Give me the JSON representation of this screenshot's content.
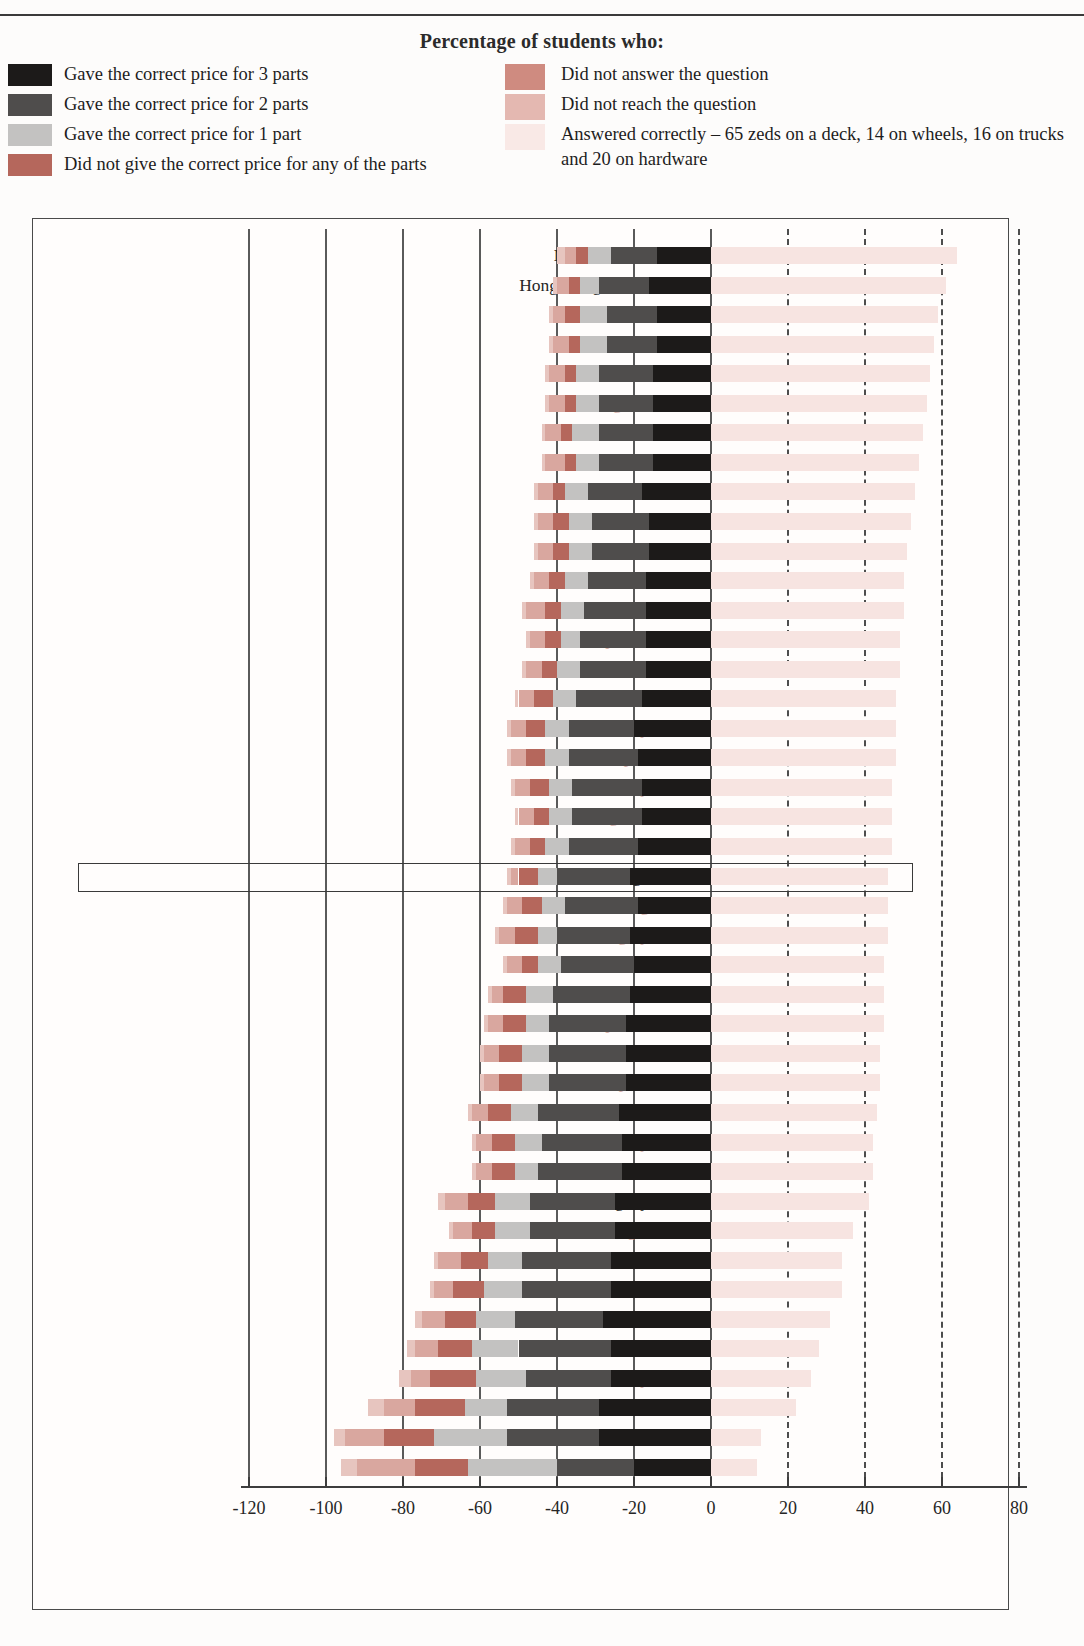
{
  "page": {
    "crumb": "",
    "legend_title": "Percentage of students who:"
  },
  "legend": {
    "left": [
      {
        "label": "Gave the correct price for 3 parts",
        "color": "#1c1a19",
        "key": "s3"
      },
      {
        "label": "Gave the correct price for 2 parts",
        "color": "#4f4d4c",
        "key": "s2"
      },
      {
        "label": "Gave the correct price for 1 part",
        "color": "#c3c2c1",
        "key": "s1"
      },
      {
        "label": "Did not give the correct price for any of the parts",
        "color": "#b5675c",
        "key": "s0"
      }
    ],
    "right": [
      {
        "label": "Did not answer the question",
        "color": "#cf8b80",
        "key": "sna"
      },
      {
        "label": "Did not reach the question",
        "color": "#e4b8b1",
        "key": "snr"
      },
      {
        "label": "Answered correctly – 65 zeds on a deck, 14 on wheels, 16 on trucks and 20 on hardware",
        "color": "#f9e9e6",
        "key": "sok"
      }
    ]
  },
  "axis": {
    "ticks": [
      "-120",
      "-100",
      "-80",
      "-60",
      "-40",
      "-20",
      "0",
      "20",
      "40",
      "60",
      "80"
    ],
    "tick_values": [
      -120,
      -100,
      -80,
      -60,
      -40,
      -20,
      0,
      20,
      40,
      60,
      80
    ],
    "min": -130,
    "max": 85,
    "dashed_from": 20
  },
  "chart_data": {
    "type": "bar",
    "orientation": "horizontal",
    "stacked": true,
    "diverging": true,
    "title": "Percentage of students who:",
    "xlabel": "",
    "ylabel": "",
    "xlim": [
      -130,
      85
    ],
    "grid": true,
    "legend_position": "top",
    "series": [
      {
        "name": "Gave the correct price for 3 parts",
        "key": "s3",
        "color": "#1c1a19",
        "side": "negative"
      },
      {
        "name": "Gave the correct price for 2 parts",
        "key": "s2",
        "color": "#4f4d4c",
        "side": "negative"
      },
      {
        "name": "Gave the correct price for 1 part",
        "key": "s1",
        "color": "#c3c2c1",
        "side": "negative"
      },
      {
        "name": "Did not give the correct price for any of the parts",
        "key": "s0",
        "color": "#b5675c",
        "side": "negative"
      },
      {
        "name": "Did not answer the question",
        "key": "sna",
        "color": "#d9a79f",
        "side": "negative"
      },
      {
        "name": "Did not reach the question",
        "key": "snr",
        "color": "#e7c5bf",
        "side": "negative"
      },
      {
        "name": "Answered correctly",
        "key": "sok",
        "color": "#f7e4e1",
        "side": "positive"
      }
    ],
    "categories": [
      "Macao-China",
      "Hong Kong-China",
      "Finland",
      "Canada",
      "Sweden",
      "Belgium",
      "Australia",
      "Netherlands",
      "New Zealand",
      "Korea",
      "Liechtenstein",
      "Iceland",
      "France",
      "Czech Republic",
      "Switzerland",
      "Denmark",
      "Norway",
      "Japan",
      "Germany",
      "United Kingdom",
      "Ireland",
      "OECD average",
      "Luxembourg",
      "Hungary",
      "Austria",
      "Latvia",
      "Slovak Republic",
      "United States",
      "Spain",
      "Russian Federation",
      "Italy",
      "Poland",
      "Uruguay",
      "Portugal",
      "Greece",
      "Serbia",
      "Mexico",
      "Thailand",
      "Turkey",
      "Brazil",
      "Tunisia",
      "Indonesia"
    ],
    "rows": [
      {
        "label": "Macao-China",
        "type": "partner",
        "s3": 14,
        "s2": 12,
        "s1": 6,
        "s0": 3,
        "sna": 3,
        "snr": 2,
        "sok": 64
      },
      {
        "label": "Hong Kong-China",
        "type": "partner",
        "s3": 16,
        "s2": 13,
        "s1": 5,
        "s0": 3,
        "sna": 3,
        "snr": 1,
        "sok": 61
      },
      {
        "label": "Finland",
        "type": "member",
        "s3": 14,
        "s2": 13,
        "s1": 7,
        "s0": 4,
        "sna": 3,
        "snr": 1,
        "sok": 59
      },
      {
        "label": "Canada",
        "type": "member",
        "s3": 14,
        "s2": 13,
        "s1": 7,
        "s0": 3,
        "sna": 4,
        "snr": 1,
        "sok": 58
      },
      {
        "label": "Sweden",
        "type": "member",
        "s3": 15,
        "s2": 14,
        "s1": 6,
        "s0": 3,
        "sna": 4,
        "snr": 1,
        "sok": 57
      },
      {
        "label": "Belgium",
        "type": "member",
        "s3": 15,
        "s2": 14,
        "s1": 6,
        "s0": 3,
        "sna": 4,
        "snr": 1,
        "sok": 56
      },
      {
        "label": "Australia",
        "type": "member",
        "s3": 15,
        "s2": 14,
        "s1": 7,
        "s0": 3,
        "sna": 4,
        "snr": 1,
        "sok": 55
      },
      {
        "label": "Netherlands",
        "type": "member",
        "s3": 15,
        "s2": 14,
        "s1": 6,
        "s0": 3,
        "sna": 5,
        "snr": 1,
        "sok": 54
      },
      {
        "label": "New Zealand",
        "type": "member",
        "s3": 18,
        "s2": 14,
        "s1": 6,
        "s0": 3,
        "sna": 4,
        "snr": 1,
        "sok": 53
      },
      {
        "label": "Korea",
        "type": "member",
        "s3": 16,
        "s2": 15,
        "s1": 6,
        "s0": 4,
        "sna": 4,
        "snr": 1,
        "sok": 52
      },
      {
        "label": "Liechtenstein",
        "type": "partner",
        "s3": 16,
        "s2": 15,
        "s1": 6,
        "s0": 4,
        "sna": 4,
        "snr": 1,
        "sok": 51
      },
      {
        "label": "Iceland",
        "type": "member",
        "s3": 17,
        "s2": 15,
        "s1": 6,
        "s0": 4,
        "sna": 4,
        "snr": 1,
        "sok": 50
      },
      {
        "label": "France",
        "type": "member",
        "s3": 17,
        "s2": 16,
        "s1": 6,
        "s0": 4,
        "sna": 5,
        "snr": 1,
        "sok": 50
      },
      {
        "label": "Czech Republic",
        "type": "member",
        "s3": 17,
        "s2": 17,
        "s1": 5,
        "s0": 4,
        "sna": 4,
        "snr": 1,
        "sok": 49
      },
      {
        "label": "Switzerland",
        "type": "member",
        "s3": 17,
        "s2": 17,
        "s1": 6,
        "s0": 4,
        "sna": 4,
        "snr": 1,
        "sok": 49
      },
      {
        "label": "Denmark",
        "type": "member",
        "s3": 18,
        "s2": 17,
        "s1": 6,
        "s0": 5,
        "sna": 4,
        "snr": 1,
        "sok": 48
      },
      {
        "label": "Norway",
        "type": "member",
        "s3": 20,
        "s2": 17,
        "s1": 6,
        "s0": 5,
        "sna": 4,
        "snr": 1,
        "sok": 48
      },
      {
        "label": "Japan",
        "type": "member",
        "s3": 19,
        "s2": 18,
        "s1": 6,
        "s0": 5,
        "sna": 4,
        "snr": 1,
        "sok": 48
      },
      {
        "label": "Germany",
        "type": "member",
        "s3": 18,
        "s2": 18,
        "s1": 6,
        "s0": 5,
        "sna": 4,
        "snr": 1,
        "sok": 47
      },
      {
        "label": "United Kingdom",
        "type": "member",
        "s3": 18,
        "s2": 18,
        "s1": 6,
        "s0": 4,
        "sna": 4,
        "snr": 1,
        "sok": 47
      },
      {
        "label": "Ireland",
        "type": "member",
        "s3": 19,
        "s2": 18,
        "s1": 6,
        "s0": 4,
        "sna": 4,
        "snr": 1,
        "sok": 47
      },
      {
        "label": "OECD average",
        "type": "oecd",
        "s3": 21,
        "s2": 19,
        "s1": 5,
        "s0": 5,
        "sna": 2,
        "snr": 1,
        "sok": 46
      },
      {
        "label": "Luxembourg",
        "type": "member",
        "s3": 19,
        "s2": 19,
        "s1": 6,
        "s0": 5,
        "sna": 4,
        "snr": 1,
        "sok": 46
      },
      {
        "label": "Hungary",
        "type": "member",
        "s3": 21,
        "s2": 19,
        "s1": 5,
        "s0": 6,
        "sna": 4,
        "snr": 1,
        "sok": 46
      },
      {
        "label": "Austria",
        "type": "member",
        "s3": 20,
        "s2": 19,
        "s1": 6,
        "s0": 4,
        "sna": 4,
        "snr": 1,
        "sok": 45
      },
      {
        "label": "Latvia",
        "type": "partner",
        "s3": 21,
        "s2": 20,
        "s1": 7,
        "s0": 6,
        "sna": 3,
        "snr": 1,
        "sok": 45
      },
      {
        "label": "Slovak Republic",
        "type": "member",
        "s3": 22,
        "s2": 20,
        "s1": 6,
        "s0": 6,
        "sna": 4,
        "snr": 1,
        "sok": 45
      },
      {
        "label": "United States",
        "type": "member",
        "s3": 22,
        "s2": 20,
        "s1": 7,
        "s0": 6,
        "sna": 4,
        "snr": 1,
        "sok": 44
      },
      {
        "label": "Spain",
        "type": "member",
        "s3": 22,
        "s2": 20,
        "s1": 7,
        "s0": 6,
        "sna": 4,
        "snr": 1,
        "sok": 44
      },
      {
        "label": "Russian Federation",
        "type": "partner",
        "s3": 24,
        "s2": 21,
        "s1": 7,
        "s0": 6,
        "sna": 4,
        "snr": 1,
        "sok": 43
      },
      {
        "label": "Italy",
        "type": "member",
        "s3": 23,
        "s2": 21,
        "s1": 7,
        "s0": 6,
        "sna": 4,
        "snr": 1,
        "sok": 42
      },
      {
        "label": "Poland",
        "type": "member",
        "s3": 23,
        "s2": 22,
        "s1": 6,
        "s0": 6,
        "sna": 4,
        "snr": 1,
        "sok": 42
      },
      {
        "label": "Uruguay",
        "type": "partner",
        "s3": 25,
        "s2": 22,
        "s1": 9,
        "s0": 7,
        "sna": 6,
        "snr": 2,
        "sok": 41
      },
      {
        "label": "Portugal",
        "type": "member",
        "s3": 25,
        "s2": 22,
        "s1": 9,
        "s0": 6,
        "sna": 5,
        "snr": 1,
        "sok": 37
      },
      {
        "label": "Greece",
        "type": "member",
        "s3": 26,
        "s2": 23,
        "s1": 9,
        "s0": 7,
        "sna": 6,
        "snr": 1,
        "sok": 34
      },
      {
        "label": "Serbia",
        "type": "partner",
        "s3": 26,
        "s2": 23,
        "s1": 10,
        "s0": 8,
        "sna": 5,
        "snr": 1,
        "sok": 34
      },
      {
        "label": "Mexico",
        "type": "member",
        "s3": 28,
        "s2": 23,
        "s1": 10,
        "s0": 8,
        "sna": 6,
        "snr": 2,
        "sok": 31
      },
      {
        "label": "Thailand",
        "type": "partner",
        "s3": 26,
        "s2": 24,
        "s1": 12,
        "s0": 9,
        "sna": 6,
        "snr": 2,
        "sok": 28
      },
      {
        "label": "Turkey",
        "type": "member",
        "s3": 26,
        "s2": 22,
        "s1": 13,
        "s0": 12,
        "sna": 5,
        "snr": 3,
        "sok": 26
      },
      {
        "label": "Brazil",
        "type": "partner",
        "s3": 29,
        "s2": 24,
        "s1": 11,
        "s0": 13,
        "sna": 8,
        "snr": 4,
        "sok": 22
      },
      {
        "label": "Tunisia",
        "type": "partner",
        "s3": 29,
        "s2": 24,
        "s1": 19,
        "s0": 13,
        "sna": 10,
        "snr": 3,
        "sok": 13
      },
      {
        "label": "Indonesia",
        "type": "partner",
        "s3": 20,
        "s2": 20,
        "s1": 23,
        "s0": 14,
        "sna": 15,
        "snr": 4,
        "sok": 12
      }
    ]
  }
}
